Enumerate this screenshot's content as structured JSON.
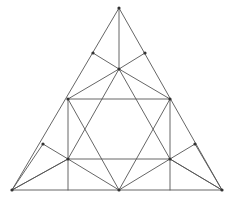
{
  "figure": {
    "canvas": {
      "width": 238,
      "height": 204
    },
    "style": {
      "background_color": "#ffffff",
      "stroke_color": "#555555",
      "node_color": "#333333",
      "stroke_width": 0.9
    },
    "points": {
      "apex": {
        "label": "A",
        "x": 119,
        "y": 8
      },
      "bottom_left": {
        "label": "B",
        "x": 12,
        "y": 190
      },
      "bottom_right": {
        "label": "C",
        "x": 222,
        "y": 190
      },
      "hub_top": {
        "label": "H",
        "x": 119,
        "y": 69
      },
      "hub_bottom": {
        "label": "M",
        "x": 119,
        "y": 190
      },
      "rect_top_left": {
        "label": "P",
        "x": 68,
        "y": 99
      },
      "rect_top_right": {
        "label": "Q",
        "x": 170,
        "y": 99
      },
      "rect_bot_left": {
        "label": "R",
        "x": 68,
        "y": 159
      },
      "rect_bot_right": {
        "label": "S",
        "x": 170,
        "y": 159
      },
      "edge_upper_left": {
        "label": "T",
        "x": 93,
        "y": 53
      },
      "edge_upper_right": {
        "label": "U",
        "x": 145,
        "y": 53
      },
      "edge_lower_left": {
        "label": "V",
        "x": 43,
        "y": 144
      },
      "edge_lower_right": {
        "label": "W",
        "x": 195,
        "y": 144
      }
    },
    "segments": [
      {
        "name": "outer-left-edge",
        "x1": 119,
        "y1": 8,
        "x2": 12,
        "y2": 190
      },
      {
        "name": "outer-right-edge",
        "x1": 119,
        "y1": 8,
        "x2": 222,
        "y2": 190
      },
      {
        "name": "outer-base-left",
        "x1": 12,
        "y1": 190,
        "x2": 119,
        "y2": 190
      },
      {
        "name": "outer-base-right",
        "x1": 119,
        "y1": 190,
        "x2": 222,
        "y2": 190
      },
      {
        "name": "apex-to-hub-vertical",
        "x1": 119,
        "y1": 8,
        "x2": 119,
        "y2": 69
      },
      {
        "name": "hub-to-upper-left-edge",
        "x1": 119,
        "y1": 69,
        "x2": 93,
        "y2": 53
      },
      {
        "name": "hub-to-upper-right-edge",
        "x1": 119,
        "y1": 69,
        "x2": 145,
        "y2": 53
      },
      {
        "name": "hub-to-rect-top-left",
        "x1": 119,
        "y1": 69,
        "x2": 68,
        "y2": 99
      },
      {
        "name": "hub-to-rect-top-right",
        "x1": 119,
        "y1": 69,
        "x2": 170,
        "y2": 99
      },
      {
        "name": "hub-to-rect-bot-left",
        "x1": 119,
        "y1": 69,
        "x2": 68,
        "y2": 159
      },
      {
        "name": "hub-to-rect-bot-right",
        "x1": 119,
        "y1": 69,
        "x2": 170,
        "y2": 159
      },
      {
        "name": "rect-top-side",
        "x1": 68,
        "y1": 99,
        "x2": 170,
        "y2": 99
      },
      {
        "name": "rect-bottom-side",
        "x1": 68,
        "y1": 159,
        "x2": 170,
        "y2": 159
      },
      {
        "name": "rect-left-side",
        "x1": 68,
        "y1": 99,
        "x2": 68,
        "y2": 159
      },
      {
        "name": "rect-right-side",
        "x1": 170,
        "y1": 99,
        "x2": 170,
        "y2": 159
      },
      {
        "name": "rect-left-col-to-base",
        "x1": 68,
        "y1": 159,
        "x2": 68,
        "y2": 190
      },
      {
        "name": "rect-right-col-to-base",
        "x1": 170,
        "y1": 159,
        "x2": 170,
        "y2": 190
      },
      {
        "name": "midbottom-to-rect-top-left",
        "x1": 119,
        "y1": 190,
        "x2": 68,
        "y2": 99
      },
      {
        "name": "midbottom-to-rect-top-right",
        "x1": 119,
        "y1": 190,
        "x2": 170,
        "y2": 99
      },
      {
        "name": "midbottom-to-rect-bot-left",
        "x1": 119,
        "y1": 190,
        "x2": 68,
        "y2": 159
      },
      {
        "name": "midbottom-to-rect-bot-right",
        "x1": 119,
        "y1": 190,
        "x2": 170,
        "y2": 159
      },
      {
        "name": "bl-corner-to-rect-bot-left",
        "x1": 12,
        "y1": 190,
        "x2": 68,
        "y2": 159
      },
      {
        "name": "bl-corner-to-lower-left-edge",
        "x1": 12,
        "y1": 190,
        "x2": 43,
        "y2": 144
      },
      {
        "name": "br-corner-to-rect-bot-right",
        "x1": 222,
        "y1": 190,
        "x2": 170,
        "y2": 159
      },
      {
        "name": "br-corner-to-lower-right-edge",
        "x1": 222,
        "y1": 190,
        "x2": 195,
        "y2": 144
      },
      {
        "name": "lower-left-edge-to-rect-bot-left",
        "x1": 43,
        "y1": 144,
        "x2": 68,
        "y2": 159
      },
      {
        "name": "lower-right-edge-to-rect-bot-right",
        "x1": 195,
        "y1": 144,
        "x2": 170,
        "y2": 159
      },
      {
        "name": "rect-bot-left-to-bl-corner-long",
        "x1": 68,
        "y1": 159,
        "x2": 12,
        "y2": 190
      },
      {
        "name": "rect-bot-right-to-br-corner-long",
        "x1": 170,
        "y1": 159,
        "x2": 222,
        "y2": 190
      }
    ]
  }
}
